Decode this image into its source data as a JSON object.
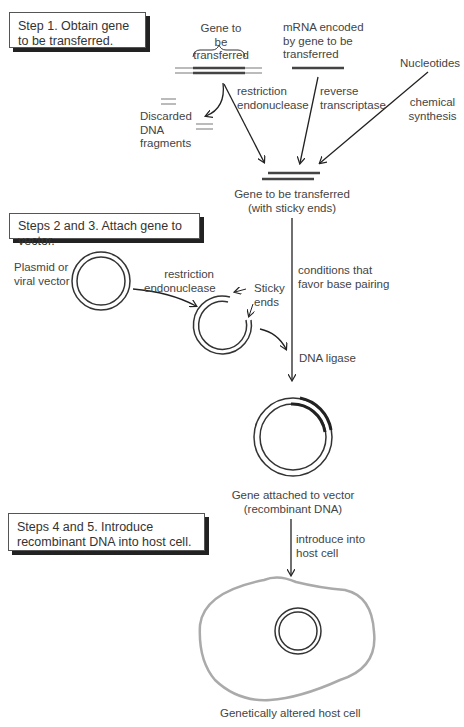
{
  "steps": {
    "step1": "Step 1. Obtain gene to be transferred.",
    "step23": "Steps 2 and 3. Attach gene to vector.",
    "step45": "Steps 4 and 5. Introduce recombinant DNA into host cell."
  },
  "labels": {
    "gene_to_be_transferred": "Gene to be transferred",
    "mrna": "mRNA encoded by gene to be transferred",
    "nucleotides": "Nucleotides",
    "restriction_endonuclease_1": "restriction endonuclease",
    "reverse_transcriptase": "reverse transcriptase",
    "chemical_synthesis": "chemical synthesis",
    "discarded": "Discarded DNA fragments",
    "gene_sticky_1": "Gene to be transferred",
    "gene_sticky_2": "(with sticky ends)",
    "plasmid": "Plasmid or viral vector",
    "restriction_endonuclease_2": "restriction endonuclease",
    "sticky_ends": "Sticky ends",
    "conditions": "conditions that favor base pairing",
    "ligase": "DNA ligase",
    "attached_1": "Gene attached to vector",
    "attached_2": "(recombinant DNA)",
    "introduce": "introduce into host cell",
    "host_cell": "Genetically altered host cell"
  }
}
